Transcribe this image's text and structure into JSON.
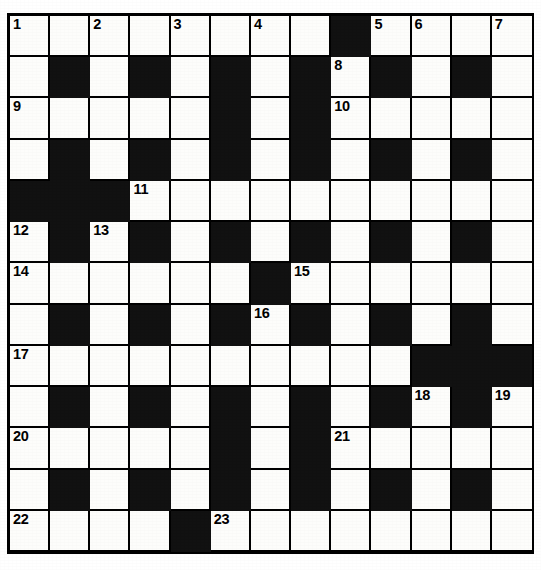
{
  "puzzle": {
    "title": "Crossword Grid",
    "type": "crossword",
    "columns": 13,
    "rows": 13,
    "colors": {
      "block": "#111111",
      "cell": "#fdfdfb",
      "border": "#000000",
      "number": "#000000"
    },
    "legend": {
      "white_cell": "letter-cell",
      "black_cell": "block-cell"
    },
    "clue_numbers": [
      1,
      2,
      3,
      4,
      5,
      6,
      7,
      8,
      9,
      10,
      11,
      12,
      13,
      14,
      15,
      16,
      17,
      18,
      19,
      20,
      21,
      22,
      23
    ],
    "grid": [
      [
        {
          "block": false,
          "number": "1"
        },
        {
          "block": false,
          "number": ""
        },
        {
          "block": false,
          "number": "2"
        },
        {
          "block": false,
          "number": ""
        },
        {
          "block": false,
          "number": "3"
        },
        {
          "block": false,
          "number": ""
        },
        {
          "block": false,
          "number": "4"
        },
        {
          "block": false,
          "number": ""
        },
        {
          "block": true,
          "number": ""
        },
        {
          "block": false,
          "number": "5"
        },
        {
          "block": false,
          "number": "6"
        },
        {
          "block": false,
          "number": ""
        },
        {
          "block": false,
          "number": "7"
        }
      ],
      [
        {
          "block": false,
          "number": ""
        },
        {
          "block": true,
          "number": ""
        },
        {
          "block": false,
          "number": ""
        },
        {
          "block": true,
          "number": ""
        },
        {
          "block": false,
          "number": ""
        },
        {
          "block": true,
          "number": ""
        },
        {
          "block": false,
          "number": ""
        },
        {
          "block": true,
          "number": ""
        },
        {
          "block": false,
          "number": "8"
        },
        {
          "block": true,
          "number": ""
        },
        {
          "block": false,
          "number": ""
        },
        {
          "block": true,
          "number": ""
        },
        {
          "block": false,
          "number": ""
        }
      ],
      [
        {
          "block": false,
          "number": "9"
        },
        {
          "block": false,
          "number": ""
        },
        {
          "block": false,
          "number": ""
        },
        {
          "block": false,
          "number": ""
        },
        {
          "block": false,
          "number": ""
        },
        {
          "block": true,
          "number": ""
        },
        {
          "block": false,
          "number": ""
        },
        {
          "block": true,
          "number": ""
        },
        {
          "block": false,
          "number": "10"
        },
        {
          "block": false,
          "number": ""
        },
        {
          "block": false,
          "number": ""
        },
        {
          "block": false,
          "number": ""
        },
        {
          "block": false,
          "number": ""
        }
      ],
      [
        {
          "block": false,
          "number": ""
        },
        {
          "block": true,
          "number": ""
        },
        {
          "block": false,
          "number": ""
        },
        {
          "block": true,
          "number": ""
        },
        {
          "block": false,
          "number": ""
        },
        {
          "block": true,
          "number": ""
        },
        {
          "block": false,
          "number": ""
        },
        {
          "block": true,
          "number": ""
        },
        {
          "block": false,
          "number": ""
        },
        {
          "block": true,
          "number": ""
        },
        {
          "block": false,
          "number": ""
        },
        {
          "block": true,
          "number": ""
        },
        {
          "block": false,
          "number": ""
        }
      ],
      [
        {
          "block": true,
          "number": ""
        },
        {
          "block": true,
          "number": ""
        },
        {
          "block": true,
          "number": ""
        },
        {
          "block": false,
          "number": "11"
        },
        {
          "block": false,
          "number": ""
        },
        {
          "block": false,
          "number": ""
        },
        {
          "block": false,
          "number": ""
        },
        {
          "block": false,
          "number": ""
        },
        {
          "block": false,
          "number": ""
        },
        {
          "block": false,
          "number": ""
        },
        {
          "block": false,
          "number": ""
        },
        {
          "block": false,
          "number": ""
        },
        {
          "block": false,
          "number": ""
        }
      ],
      [
        {
          "block": false,
          "number": "12"
        },
        {
          "block": true,
          "number": ""
        },
        {
          "block": false,
          "number": "13"
        },
        {
          "block": true,
          "number": ""
        },
        {
          "block": false,
          "number": ""
        },
        {
          "block": true,
          "number": ""
        },
        {
          "block": false,
          "number": ""
        },
        {
          "block": true,
          "number": ""
        },
        {
          "block": false,
          "number": ""
        },
        {
          "block": true,
          "number": ""
        },
        {
          "block": false,
          "number": ""
        },
        {
          "block": true,
          "number": ""
        },
        {
          "block": false,
          "number": ""
        }
      ],
      [
        {
          "block": false,
          "number": "14"
        },
        {
          "block": false,
          "number": ""
        },
        {
          "block": false,
          "number": ""
        },
        {
          "block": false,
          "number": ""
        },
        {
          "block": false,
          "number": ""
        },
        {
          "block": false,
          "number": ""
        },
        {
          "block": true,
          "number": ""
        },
        {
          "block": false,
          "number": "15"
        },
        {
          "block": false,
          "number": ""
        },
        {
          "block": false,
          "number": ""
        },
        {
          "block": false,
          "number": ""
        },
        {
          "block": false,
          "number": ""
        },
        {
          "block": false,
          "number": ""
        }
      ],
      [
        {
          "block": false,
          "number": ""
        },
        {
          "block": true,
          "number": ""
        },
        {
          "block": false,
          "number": ""
        },
        {
          "block": true,
          "number": ""
        },
        {
          "block": false,
          "number": ""
        },
        {
          "block": true,
          "number": ""
        },
        {
          "block": false,
          "number": "16"
        },
        {
          "block": true,
          "number": ""
        },
        {
          "block": false,
          "number": ""
        },
        {
          "block": true,
          "number": ""
        },
        {
          "block": false,
          "number": ""
        },
        {
          "block": true,
          "number": ""
        },
        {
          "block": false,
          "number": ""
        }
      ],
      [
        {
          "block": false,
          "number": "17"
        },
        {
          "block": false,
          "number": ""
        },
        {
          "block": false,
          "number": ""
        },
        {
          "block": false,
          "number": ""
        },
        {
          "block": false,
          "number": ""
        },
        {
          "block": false,
          "number": ""
        },
        {
          "block": false,
          "number": ""
        },
        {
          "block": false,
          "number": ""
        },
        {
          "block": false,
          "number": ""
        },
        {
          "block": false,
          "number": ""
        },
        {
          "block": true,
          "number": ""
        },
        {
          "block": true,
          "number": ""
        },
        {
          "block": true,
          "number": ""
        }
      ],
      [
        {
          "block": false,
          "number": ""
        },
        {
          "block": true,
          "number": ""
        },
        {
          "block": false,
          "number": ""
        },
        {
          "block": true,
          "number": ""
        },
        {
          "block": false,
          "number": ""
        },
        {
          "block": true,
          "number": ""
        },
        {
          "block": false,
          "number": ""
        },
        {
          "block": true,
          "number": ""
        },
        {
          "block": false,
          "number": ""
        },
        {
          "block": true,
          "number": ""
        },
        {
          "block": false,
          "number": "18"
        },
        {
          "block": true,
          "number": ""
        },
        {
          "block": false,
          "number": "19"
        }
      ],
      [
        {
          "block": false,
          "number": "20"
        },
        {
          "block": false,
          "number": ""
        },
        {
          "block": false,
          "number": ""
        },
        {
          "block": false,
          "number": ""
        },
        {
          "block": false,
          "number": ""
        },
        {
          "block": true,
          "number": ""
        },
        {
          "block": false,
          "number": ""
        },
        {
          "block": true,
          "number": ""
        },
        {
          "block": false,
          "number": "21"
        },
        {
          "block": false,
          "number": ""
        },
        {
          "block": false,
          "number": ""
        },
        {
          "block": false,
          "number": ""
        },
        {
          "block": false,
          "number": ""
        }
      ],
      [
        {
          "block": false,
          "number": ""
        },
        {
          "block": true,
          "number": ""
        },
        {
          "block": false,
          "number": ""
        },
        {
          "block": true,
          "number": ""
        },
        {
          "block": false,
          "number": ""
        },
        {
          "block": true,
          "number": ""
        },
        {
          "block": false,
          "number": ""
        },
        {
          "block": true,
          "number": ""
        },
        {
          "block": false,
          "number": ""
        },
        {
          "block": true,
          "number": ""
        },
        {
          "block": false,
          "number": ""
        },
        {
          "block": true,
          "number": ""
        },
        {
          "block": false,
          "number": ""
        }
      ],
      [
        {
          "block": false,
          "number": "22"
        },
        {
          "block": false,
          "number": ""
        },
        {
          "block": false,
          "number": ""
        },
        {
          "block": false,
          "number": ""
        },
        {
          "block": true,
          "number": ""
        },
        {
          "block": false,
          "number": "23"
        },
        {
          "block": false,
          "number": ""
        },
        {
          "block": false,
          "number": ""
        },
        {
          "block": false,
          "number": ""
        },
        {
          "block": false,
          "number": ""
        },
        {
          "block": false,
          "number": ""
        },
        {
          "block": false,
          "number": ""
        },
        {
          "block": false,
          "number": ""
        }
      ]
    ]
  }
}
